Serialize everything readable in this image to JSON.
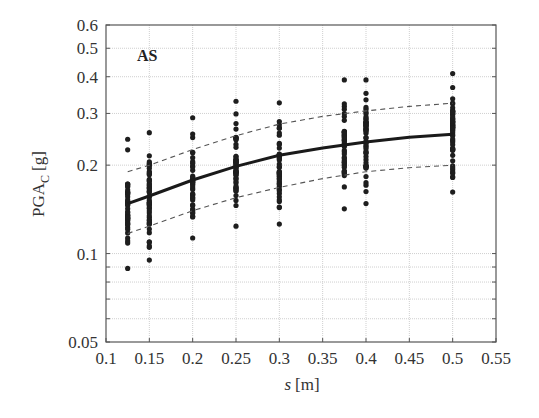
{
  "chart_data": {
    "type": "scatter",
    "title": "",
    "panel_label": "AS",
    "xlabel_italic": "s",
    "xlabel_unit": "[m]",
    "ylabel_main": "PGA",
    "ylabel_sub": "C",
    "ylabel_unit": "[g]",
    "xlim": [
      0.1,
      0.55
    ],
    "ylim": [
      0.05,
      0.6
    ],
    "yscale": "log",
    "grid": true,
    "x_ticks": [
      0.1,
      0.15,
      0.2,
      0.25,
      0.3,
      0.35,
      0.4,
      0.45,
      0.5,
      0.55
    ],
    "x_tick_labels": [
      "0.1",
      "0.15",
      "0.2",
      "0.25",
      "0.3",
      "0.35",
      "0.4",
      "0.45",
      "0.5",
      "0.55"
    ],
    "y_ticks": [
      0.05,
      0.1,
      0.2,
      0.3,
      0.4,
      0.5,
      0.6
    ],
    "y_tick_labels": [
      "0.05",
      "0.1",
      "0.2",
      "0.3",
      "0.4",
      "0.5",
      "0.6"
    ],
    "y_minor_grid": [
      0.06,
      0.07,
      0.08,
      0.09
    ],
    "scatter_columns": [
      {
        "s": 0.125,
        "min": 0.089,
        "max": 0.245,
        "count": 45
      },
      {
        "s": 0.15,
        "min": 0.095,
        "max": 0.258,
        "count": 50
      },
      {
        "s": 0.2,
        "min": 0.113,
        "max": 0.29,
        "count": 40
      },
      {
        "s": 0.25,
        "min": 0.124,
        "max": 0.33,
        "count": 50
      },
      {
        "s": 0.3,
        "min": 0.126,
        "max": 0.326,
        "count": 45
      },
      {
        "s": 0.375,
        "min": 0.142,
        "max": 0.39,
        "count": 45
      },
      {
        "s": 0.4,
        "min": 0.148,
        "max": 0.39,
        "count": 50
      },
      {
        "s": 0.5,
        "min": 0.162,
        "max": 0.41,
        "count": 55
      }
    ],
    "series": [
      {
        "name": "median fit",
        "style": "solid-thick",
        "x": [
          0.125,
          0.15,
          0.2,
          0.25,
          0.3,
          0.35,
          0.4,
          0.45,
          0.5
        ],
        "values": [
          0.148,
          0.157,
          0.178,
          0.198,
          0.216,
          0.229,
          0.24,
          0.249,
          0.255
        ]
      },
      {
        "name": "upper band (+1σ)",
        "style": "dashed",
        "x": [
          0.125,
          0.15,
          0.2,
          0.25,
          0.3,
          0.35,
          0.4,
          0.45,
          0.5
        ],
        "values": [
          0.19,
          0.2,
          0.226,
          0.252,
          0.276,
          0.293,
          0.306,
          0.317,
          0.325
        ]
      },
      {
        "name": "lower band (−1σ)",
        "style": "dashed",
        "x": [
          0.125,
          0.15,
          0.2,
          0.25,
          0.3,
          0.35,
          0.4,
          0.45,
          0.5
        ],
        "values": [
          0.117,
          0.124,
          0.14,
          0.155,
          0.168,
          0.18,
          0.19,
          0.196,
          0.2
        ]
      }
    ]
  }
}
